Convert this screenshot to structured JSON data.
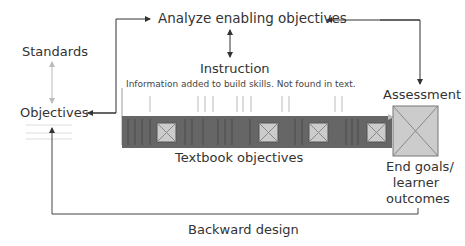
{
  "diagram": {
    "nodes": {
      "analyze": "Analyze enabling objectives",
      "instruction": "Instruction",
      "instruction_note": "Information added to build skills. Not found in text.",
      "standards": "Standards",
      "objectives": "Objectives",
      "assessment": "Assessment",
      "textbook": "Textbook objectives",
      "end_goals_1": "End goals/",
      "end_goals_2": "learner",
      "end_goals_3": "outcomes",
      "backward": "Backward design"
    },
    "colors": {
      "line": "#444444",
      "bar": "#666666",
      "box_fill": "#cccccc",
      "light_arrow": "#bbbbbb"
    }
  }
}
